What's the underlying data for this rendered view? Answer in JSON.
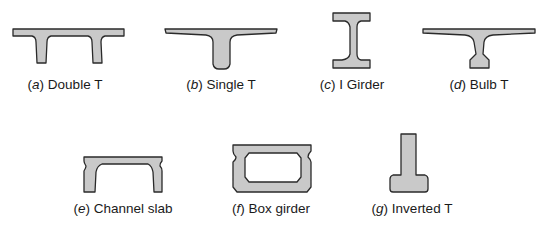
{
  "figure": {
    "sections": [
      {
        "id": "a",
        "letter": "a",
        "name": "Double T"
      },
      {
        "id": "b",
        "letter": "b",
        "name": "Single T"
      },
      {
        "id": "c",
        "letter": "c",
        "name": "I Girder"
      },
      {
        "id": "d",
        "letter": "d",
        "name": "Bulb T"
      },
      {
        "id": "e",
        "letter": "e",
        "name": "Channel slab"
      },
      {
        "id": "f",
        "letter": "f",
        "name": "Box girder"
      },
      {
        "id": "g",
        "letter": "g",
        "name": "Inverted T"
      }
    ],
    "colors": {
      "fill": "#c9c9c9",
      "stroke": "#2a2a2a",
      "text": "#1a1a1a"
    }
  }
}
